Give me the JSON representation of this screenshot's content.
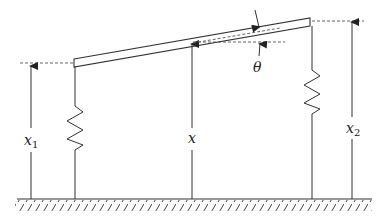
{
  "diagram": {
    "labels": {
      "x1": {
        "main": "x",
        "sub": "1"
      },
      "x": {
        "main": "x"
      },
      "x2": {
        "main": "x",
        "sub": "2"
      },
      "theta": "θ"
    },
    "colors": {
      "stroke": "#333333",
      "dashed": "#555555",
      "background": "#ffffff"
    }
  }
}
